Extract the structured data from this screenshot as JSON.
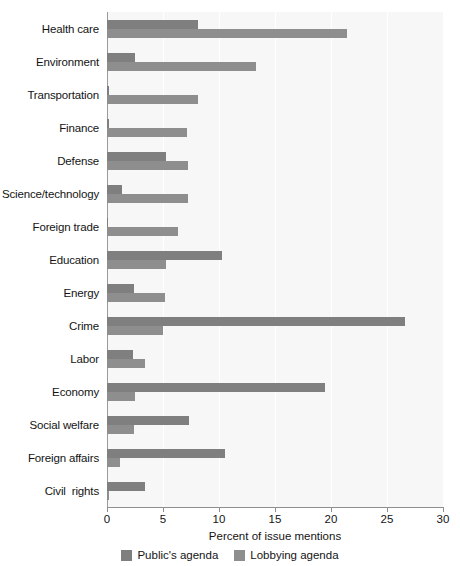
{
  "chart_data": {
    "type": "bar",
    "orientation": "horizontal",
    "title": "",
    "xlabel": "Percent of issue mentions",
    "ylabel": "",
    "xlim": [
      0,
      30
    ],
    "xticks": [
      0,
      5,
      10,
      15,
      20,
      25,
      30
    ],
    "grid": true,
    "legend_position": "bottom",
    "categories": [
      "Health care",
      "Environment",
      "Transportation",
      "Finance",
      "Defense",
      "Science/technology",
      "Foreign trade",
      "Education",
      "Energy",
      "Crime",
      "Labor",
      "Economy",
      "Social welfare",
      "Foreign affairs",
      "Civil  rights"
    ],
    "series": [
      {
        "name": "Public's agenda",
        "color": "#7f7f7f",
        "values": [
          8.1,
          2.5,
          0.2,
          0.2,
          5.3,
          1.3,
          0.1,
          10.3,
          2.4,
          26.6,
          2.3,
          19.5,
          7.3,
          10.5,
          3.4
        ]
      },
      {
        "name": "Lobbying agenda",
        "color": "#8e8e8e",
        "values": [
          21.4,
          13.3,
          8.1,
          7.1,
          7.2,
          7.2,
          6.3,
          5.3,
          5.2,
          5.0,
          3.4,
          2.5,
          2.4,
          1.2,
          0.2
        ]
      }
    ]
  },
  "colors": {
    "plot_background": "#f7f7f7",
    "page_background": "#ffffff",
    "gridline": "#ffffff",
    "axis": "#8f8f8f",
    "text": "#141414"
  }
}
